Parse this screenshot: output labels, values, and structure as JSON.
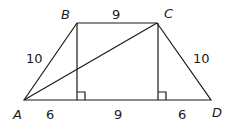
{
  "figure": {
    "type": "isosceles-trapezoid",
    "vertices": {
      "A": {
        "label": "A",
        "x": 24,
        "y": 100,
        "lx": 13,
        "ly": 119
      },
      "B": {
        "label": "B",
        "x": 77,
        "y": 23,
        "lx": 61,
        "ly": 19
      },
      "C": {
        "label": "C",
        "x": 157,
        "y": 23,
        "lx": 164,
        "ly": 18
      },
      "D": {
        "label": "D",
        "x": 211,
        "y": 100,
        "lx": 212,
        "ly": 117
      }
    },
    "feet": {
      "B_foot": {
        "x": 77,
        "y": 100
      },
      "C_foot": {
        "x": 158,
        "y": 100
      }
    },
    "measurements": {
      "AB": {
        "text": "10",
        "x": 26,
        "y": 63
      },
      "BC": {
        "text": "9",
        "x": 112,
        "y": 19
      },
      "CD": {
        "text": "10",
        "x": 193,
        "y": 63
      },
      "A_to_Bfoot": {
        "text": "6",
        "x": 46,
        "y": 119
      },
      "Bfoot_to_Cfoot": {
        "text": "9",
        "x": 114,
        "y": 119
      },
      "Cfoot_to_D": {
        "text": "6",
        "x": 178,
        "y": 119
      }
    },
    "segments": [
      "AB",
      "BC",
      "CD",
      "DA",
      "AC",
      "B-altitude",
      "C-altitude"
    ],
    "right_angle_marks": 2
  }
}
